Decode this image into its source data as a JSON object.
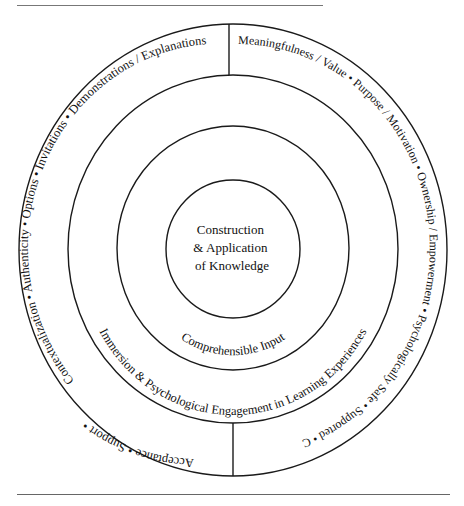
{
  "diagram": {
    "center": {
      "lines": [
        "Construction",
        "& Application",
        "of Knowledge"
      ]
    },
    "ring_comprehensible": {
      "label": "Comprehensible Input"
    },
    "ring_immersion": {
      "label": "Immersion & Psychological Engagement in Learning Experiences"
    },
    "outer_ring": {
      "left_segment": {
        "label": "Contextualization  •  Authenticity  •  Options  •  Invitations  •  Demonstrations / Explanations",
        "bottom_label": "Acceptance  •  Support  •",
        "items": [
          "Demonstrations / Explanations",
          "Invitations",
          "Options",
          "Authenticity",
          "Contextualization",
          "Support",
          "Acceptance"
        ]
      },
      "right_segment": {
        "label": "Meaningfulness / Value • Purpose / Motivation • Ownership / Empowerment • Psychologically Safe • Supported • Confident / Capable",
        "items": [
          "Meaningfulness / Value",
          "Purpose / Motivation",
          "Ownership / Empowerment",
          "Psychologically Safe",
          "Supported",
          "Confident / Capable"
        ]
      }
    },
    "colors": {
      "stroke": "#1a1a1a",
      "text": "#111111",
      "background": "#ffffff"
    }
  }
}
